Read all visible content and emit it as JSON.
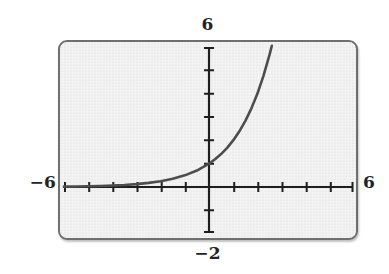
{
  "window": {
    "title": "Graphing calculator exponential function plot",
    "screen_bg": "#ececec",
    "frame_color": "#6f6f6f",
    "curve_color": "#4d4d4d",
    "axis_color": "#1f1f1f",
    "label_color": "#242424"
  },
  "labels": {
    "ymax": "6",
    "xmin": "−6",
    "xmax": "6",
    "ymin": "−2"
  },
  "chart_data": {
    "type": "line",
    "title": "",
    "xlabel": "",
    "ylabel": "",
    "xlim": [
      -6,
      6
    ],
    "ylim": [
      -2,
      6
    ],
    "xtick_step": 1,
    "ytick_step": 1,
    "grid": false,
    "legend": null,
    "axis_style": "calculator-screen",
    "tick_labels": {
      "left": "−6",
      "right": "6",
      "top": "6",
      "bottom": "−2"
    },
    "series": [
      {
        "name": "exponential growth curve",
        "equation": "y = 2^x",
        "color": "#4d4d4d",
        "line_width": 2.6,
        "x": [
          -6,
          -5.5,
          -5,
          -4.5,
          -4,
          -3.5,
          -3,
          -2.5,
          -2,
          -1.5,
          -1,
          -0.5,
          0,
          0.25,
          0.5,
          0.75,
          1,
          1.25,
          1.5,
          1.75,
          2,
          2.25,
          2.5,
          2.6,
          2.7
        ],
        "y": [
          0.016,
          0.022,
          0.031,
          0.044,
          0.063,
          0.088,
          0.125,
          0.177,
          0.25,
          0.354,
          0.5,
          0.707,
          1.0,
          1.19,
          1.414,
          1.682,
          2.0,
          2.378,
          2.828,
          3.364,
          4.0,
          4.757,
          5.657,
          6.063,
          6.498
        ]
      }
    ],
    "key_points": [
      {
        "label": "y-intercept",
        "x": 0,
        "y": 1
      },
      {
        "label": "exits top of window",
        "x": 2.585,
        "y": 6
      }
    ],
    "asymptote": {
      "type": "horizontal",
      "y": 0
    }
  }
}
